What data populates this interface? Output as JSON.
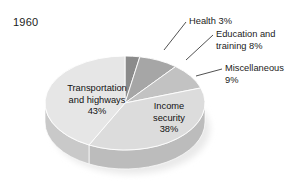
{
  "figure": {
    "title": "1960",
    "background_color": "#ffffff"
  },
  "callouts": [
    {
      "name": "health",
      "text_line1": "Health 3%",
      "text_line2": ""
    },
    {
      "name": "education",
      "text_line1": "Education and",
      "text_line2": "training 8%"
    },
    {
      "name": "miscellaneous",
      "text_line1": "Miscellaneous",
      "text_line2": "9%"
    }
  ],
  "inner_labels": [
    {
      "name": "transportation",
      "line1": "Transportation",
      "line2": "and highways",
      "line3": "43%"
    },
    {
      "name": "income",
      "line1": "Income",
      "line2": "security",
      "line3": "38%"
    }
  ],
  "chart_data": {
    "type": "pie",
    "title": "1960",
    "subtitle": "",
    "xlabel": "",
    "ylabel": "",
    "units": "percent",
    "total": 101,
    "start_angle_deg": 0,
    "direction": "clockwise",
    "three_d": true,
    "legend": "none",
    "grid": false,
    "labels": [
      "Health",
      "Education and training",
      "Miscellaneous",
      "Income security",
      "Transportation and highways"
    ],
    "values": [
      3,
      8,
      9,
      38,
      43
    ],
    "value_labels": [
      "3%",
      "8%",
      "9%",
      "38%",
      "43%"
    ],
    "colors": [
      "#8b8b8b",
      "#a6a6a6",
      "#c2c2c2",
      "#dcdcdc",
      "#e6e6e6"
    ],
    "side_colors": [
      "#6f6f6f",
      "#8a8a8a",
      "#a4a4a4",
      "#bcbcbc",
      "#c9c9c9"
    ],
    "label_placement": [
      "callout",
      "callout",
      "callout",
      "inside",
      "inside"
    ],
    "slices": [
      {
        "label": "Health",
        "value": 3,
        "value_label": "3%",
        "color": "#8b8b8b",
        "placement": "callout"
      },
      {
        "label": "Education and training",
        "value": 8,
        "value_label": "8%",
        "color": "#a6a6a6",
        "placement": "callout"
      },
      {
        "label": "Miscellaneous",
        "value": 9,
        "value_label": "9%",
        "color": "#c2c2c2",
        "placement": "callout"
      },
      {
        "label": "Income security",
        "value": 38,
        "value_label": "38%",
        "color": "#dcdcdc",
        "placement": "inside"
      },
      {
        "label": "Transportation and highways",
        "value": 43,
        "value_label": "43%",
        "color": "#e6e6e6",
        "placement": "inside"
      }
    ]
  }
}
